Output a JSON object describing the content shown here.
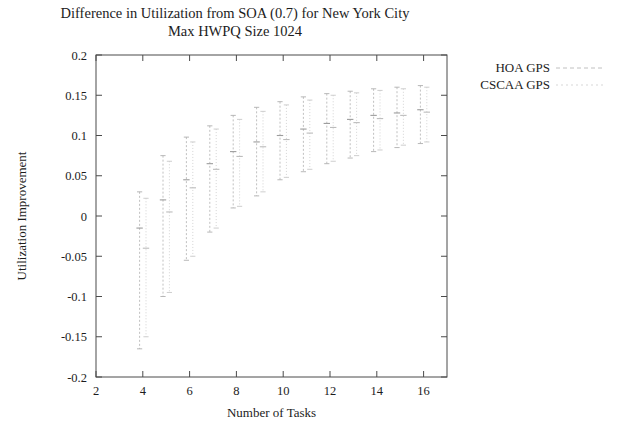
{
  "chart_data": {
    "type": "scatter",
    "title": "Difference in Utilization from SOA (0.7) for New York City",
    "subtitle": "Max HWPQ Size 1024",
    "xlabel": "Number of Tasks",
    "ylabel": "Utilization Improvement",
    "xlim": [
      2,
      17
    ],
    "ylim": [
      -0.2,
      0.2
    ],
    "xticks": [
      2,
      4,
      6,
      8,
      10,
      12,
      14,
      16
    ],
    "yticks": [
      -0.2,
      -0.15,
      -0.1,
      -0.05,
      0,
      0.05,
      0.1,
      0.15,
      0.2
    ],
    "grid": false,
    "legend_position": "right-top",
    "series": [
      {
        "name": "HOA GPS",
        "color": "#b9b9b9",
        "style": "errorbars-dashed",
        "x": [
          4,
          5,
          6,
          7,
          8,
          9,
          10,
          11,
          12,
          13,
          14,
          15,
          16
        ],
        "mean": [
          -0.015,
          0.02,
          0.045,
          0.065,
          0.08,
          0.092,
          0.1,
          0.108,
          0.115,
          0.12,
          0.125,
          0.128,
          0.132
        ],
        "lower": [
          -0.165,
          -0.1,
          -0.055,
          -0.02,
          0.01,
          0.025,
          0.045,
          0.055,
          0.065,
          0.072,
          0.08,
          0.085,
          0.09
        ],
        "upper": [
          0.03,
          0.075,
          0.098,
          0.112,
          0.125,
          0.135,
          0.142,
          0.148,
          0.152,
          0.155,
          0.158,
          0.16,
          0.162
        ]
      },
      {
        "name": "CSCAA GPS",
        "color": "#d0d0d0",
        "style": "errorbars-dotted",
        "x": [
          4,
          5,
          6,
          7,
          8,
          9,
          10,
          11,
          12,
          13,
          14,
          15,
          16
        ],
        "mean": [
          -0.04,
          0.005,
          0.035,
          0.058,
          0.074,
          0.086,
          0.095,
          0.103,
          0.11,
          0.116,
          0.121,
          0.125,
          0.129
        ],
        "lower": [
          -0.15,
          -0.095,
          -0.05,
          -0.015,
          0.012,
          0.03,
          0.048,
          0.058,
          0.068,
          0.075,
          0.082,
          0.088,
          0.092
        ],
        "upper": [
          0.022,
          0.068,
          0.092,
          0.108,
          0.12,
          0.13,
          0.138,
          0.144,
          0.15,
          0.153,
          0.156,
          0.158,
          0.16
        ]
      }
    ]
  },
  "legend": {
    "entries": [
      {
        "label": "HOA GPS"
      },
      {
        "label": "CSCAA GPS"
      }
    ]
  }
}
